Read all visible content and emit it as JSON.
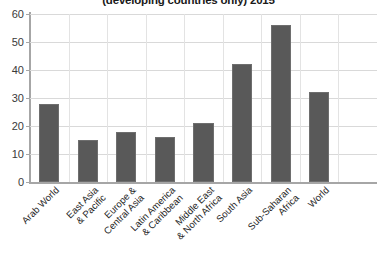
{
  "chart_data": {
    "type": "bar",
    "title": "(developing countries only) 2015",
    "xlabel": "",
    "ylabel": "",
    "ylim": [
      0,
      60
    ],
    "yticks": [
      0,
      10,
      20,
      30,
      40,
      50,
      60
    ],
    "grid": true,
    "legend": "none",
    "bar_color": "#595959",
    "categories": [
      "Arab World",
      "East Asia & Pacific",
      "Europe & Central Asia",
      "Latin America & Caribbean",
      "Middle East & North Africa",
      "South Asia",
      "Sub-Saharan Africa",
      "World"
    ],
    "category_lines": [
      [
        "Arab World"
      ],
      [
        "East Asia",
        "& Pacific"
      ],
      [
        "Europe &",
        "Central Asia"
      ],
      [
        "Latin America",
        "& Caribbean"
      ],
      [
        "Middle East",
        "& North Africa"
      ],
      [
        "South Asia"
      ],
      [
        "Sub-Saharan",
        "Africa"
      ],
      [
        "World"
      ]
    ],
    "values": [
      28,
      15,
      18,
      16,
      21,
      42,
      56,
      32
    ]
  }
}
